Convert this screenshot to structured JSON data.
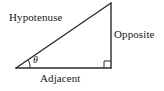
{
  "diagram": {
    "type": "right-triangle-trigonometry",
    "background_color": "#ffffff",
    "stroke_color": "#2b2b2b",
    "text_color": "#1a1a1a",
    "labels": {
      "hypotenuse": "Hypotenuse",
      "opposite": "Opposite",
      "adjacent": "Adjacent",
      "angle": "θ"
    },
    "geometry": {
      "vertex_left": [
        16,
        68
      ],
      "vertex_apex": [
        111,
        3
      ],
      "vertex_right_angle": [
        111,
        68
      ],
      "angle_arc_radius": 14,
      "right_angle_marker_size": 7
    }
  }
}
